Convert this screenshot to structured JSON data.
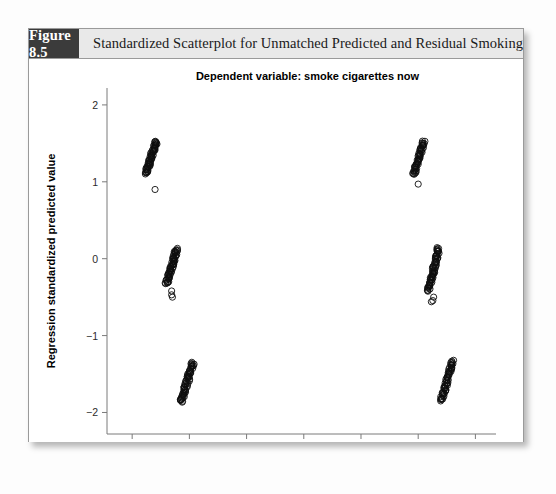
{
  "figure": {
    "tag": "Figure 8.5",
    "caption": "Standardized Scatterplot for Unmatched Predicted and Residual Smoking"
  },
  "colors": {
    "tag_background": "#3b3b3b",
    "header_background": "#e9e9e9",
    "border": "#9a9a9a",
    "marker": "#0d0d0d",
    "axis": "#7a7a7a"
  },
  "chart_data": {
    "type": "scatter",
    "title": "Dependent variable: smoke cigarettes now",
    "xlabel": "Regression standardized residual",
    "ylabel": "Regression standardized predicted value",
    "xlim": [
      -2.22,
      1.18
    ],
    "ylim": [
      -2.28,
      2.22
    ],
    "xticks": [
      -2.0,
      -1.5,
      -1.0,
      -0.5,
      0.0,
      0.5,
      1.0
    ],
    "xticklabels": [
      "-2.0",
      "-1.5",
      "-1.0",
      "-0.5",
      "0.0",
      "0.5",
      "1.0"
    ],
    "yticks": [
      -2,
      -1,
      0,
      1,
      2
    ],
    "yticklabels": [
      "-2",
      "-1",
      "0",
      "1",
      "2"
    ],
    "grid": false,
    "legend": null,
    "marker_style": "open-circle",
    "marker_size": 3.1,
    "clusters": [
      {
        "name": "upper-left",
        "x_range": [
          -1.88,
          -1.79
        ],
        "y_range": [
          1.1,
          1.53
        ],
        "n": 58,
        "outliers": [
          {
            "x": -1.8,
            "y": 0.9
          }
        ]
      },
      {
        "name": "upper-right",
        "x_range": [
          0.46,
          0.55
        ],
        "y_range": [
          1.09,
          1.53
        ],
        "n": 52,
        "outliers": [
          {
            "x": 0.5,
            "y": 0.97
          }
        ]
      },
      {
        "name": "middle-left",
        "x_range": [
          -1.7,
          -1.61
        ],
        "y_range": [
          -0.33,
          0.13
        ],
        "n": 60,
        "outliers": [
          {
            "x": -1.655,
            "y": -0.42
          },
          {
            "x": -1.655,
            "y": -0.47
          },
          {
            "x": -1.648,
            "y": -0.5
          }
        ]
      },
      {
        "name": "middle-right",
        "x_range": [
          0.59,
          0.68
        ],
        "y_range": [
          -0.42,
          0.14
        ],
        "n": 66,
        "outliers": [
          {
            "x": 0.635,
            "y": -0.5
          },
          {
            "x": 0.628,
            "y": -0.545
          },
          {
            "x": 0.615,
            "y": -0.56
          }
        ]
      },
      {
        "name": "lower-left",
        "x_range": [
          -1.57,
          -1.47
        ],
        "y_range": [
          -1.87,
          -1.35
        ],
        "n": 62,
        "outliers": []
      },
      {
        "name": "lower-right",
        "x_range": [
          0.7,
          0.8
        ],
        "y_range": [
          -1.85,
          -1.33
        ],
        "n": 58,
        "outliers": []
      }
    ]
  }
}
